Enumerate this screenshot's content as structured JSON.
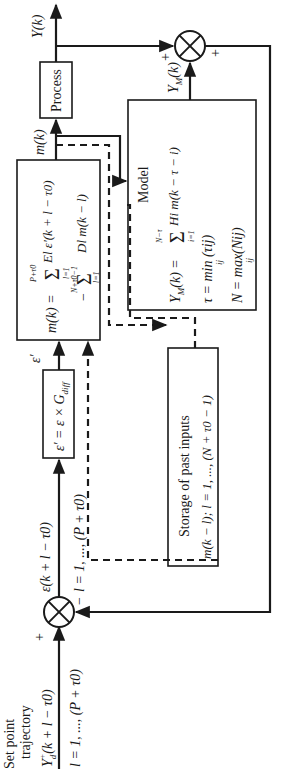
{
  "diagram": {
    "orientation": "rotated 90 degrees counterclockwise",
    "setpoint": {
      "label_line1": "Set point",
      "label_line2": "trajectory",
      "signal": "Yd+(k + l − τ0)",
      "signal_main": "Y",
      "signal_sub": "d",
      "signal_sup": "+",
      "signal_args": "(k + l − τ0)",
      "range": "l = 1, ..., (P + τ0)"
    },
    "sum_junction_left": {
      "plus_sign": "+",
      "minus_sign": "−"
    },
    "error_signal": {
      "label": "ε(k + l − τ0)",
      "range": "l = 1, ..., (P + τ0)"
    },
    "gain_box": {
      "label": "ε′ = ε × Gdiff",
      "main": "ε′ = ε ×",
      "g": "G",
      "sub": "diff"
    },
    "gain_output": "ε′",
    "controller_box": {
      "line1_lhs": "m(k) =",
      "line1_sum_top": "P+τ0",
      "line1_sum_bottom": "l=1",
      "line1_term": "El ε′(k + l − τ0)",
      "line2_sign": "−",
      "line2_sum_top": "N+τ0−1",
      "line2_sum_bottom": "l=1",
      "line2_term": "Dl m(k − l)"
    },
    "controller_output": "m(k)",
    "process_box": {
      "label": "Process"
    },
    "process_output": "Y(k)",
    "sum_junction_right": {
      "plus_top": "+",
      "plus_bottom": "+"
    },
    "model_box": {
      "title": "Model",
      "eq1_lhs": "YM(k) =",
      "eq1_sum_top": "N−τ",
      "eq1_sum_bottom": "i=1",
      "eq1_term": "Hi m(k − τ − i)",
      "eq2": "τ = min (τij)",
      "eq2_sub": "ij",
      "eq3": "N = max(Nij)",
      "eq3_sub": "ij"
    },
    "model_output": "YM(k)",
    "storage_box": {
      "title": "Storage of past inputs",
      "content": "m(k − l); l = 1, ..., (N + τ0 − 1)"
    },
    "colors": {
      "line": "#1a1a1a",
      "background": "#ffffff"
    }
  }
}
